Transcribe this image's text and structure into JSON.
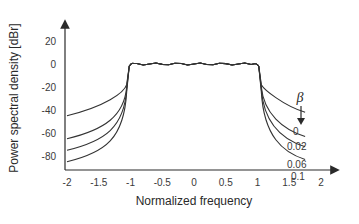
{
  "chart_data": {
    "type": "line",
    "title": "",
    "xlabel": "Normalized frequency",
    "ylabel": "Power spectral density [dBr]",
    "xlim": [
      -2,
      2
    ],
    "ylim": [
      -90,
      30
    ],
    "xticks": [
      "-2",
      "-1.5",
      "-1",
      "-0.5",
      "0",
      "0.5",
      "1",
      "1.5",
      "2"
    ],
    "yticks": [
      "20",
      "0",
      "-20",
      "-40",
      "-60",
      "-80"
    ],
    "grid": false,
    "legend_title": "β",
    "legend_position": "right, labels next to curves with downward arrow",
    "series": [
      {
        "name": "0",
        "x": [
          -2,
          -1.5,
          -1.2,
          -1.05,
          -1,
          0,
          1,
          1.05,
          1.2,
          1.5,
          1.75
        ],
        "y": [
          -45,
          -38,
          -28,
          -15,
          0,
          0,
          0,
          -15,
          -28,
          -38,
          -42
        ]
      },
      {
        "name": "0.02",
        "x": [
          -2,
          -1.5,
          -1.2,
          -1.05,
          -1,
          0,
          1,
          1.05,
          1.2,
          1.5,
          1.75
        ],
        "y": [
          -65,
          -58,
          -48,
          -30,
          0,
          0,
          0,
          -30,
          -48,
          -58,
          -63
        ]
      },
      {
        "name": "0.06",
        "x": [
          -2,
          -1.5,
          -1.2,
          -1.05,
          -1,
          0,
          1,
          1.05,
          1.2,
          1.5,
          1.75
        ],
        "y": [
          -75,
          -68,
          -58,
          -40,
          0,
          0,
          0,
          -40,
          -58,
          -68,
          -72
        ]
      },
      {
        "name": "0.1",
        "x": [
          -2,
          -1.5,
          -1.2,
          -1.05,
          -1,
          0,
          1,
          1.05,
          1.2,
          1.5,
          1.75
        ],
        "y": [
          -85,
          -78,
          -68,
          -50,
          0,
          0,
          0,
          -50,
          -68,
          -78,
          -83
        ]
      }
    ],
    "annotations": [
      "β",
      "0",
      "0.02",
      "0.06",
      "0.1"
    ]
  },
  "labels": {
    "beta": "β",
    "arrow": "↓"
  }
}
